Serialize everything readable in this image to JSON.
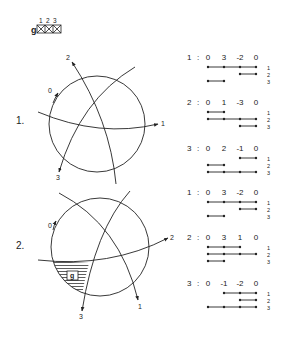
{
  "legend": {
    "prefix": "g",
    "columns": [
      "1",
      "2",
      "3"
    ]
  },
  "diagrams": [
    {
      "label": "1.",
      "curve_labels": {
        "c0": "0",
        "c1": "1",
        "c2": "2",
        "c3": "3"
      },
      "shaded_label": ""
    },
    {
      "label": "2.",
      "curve_labels": {
        "c0": "0",
        "c1": "1",
        "c2": "2",
        "c3": "3"
      },
      "shaded_label": "g"
    }
  ],
  "tables": [
    {
      "group": 1,
      "blocks": [
        {
          "head": "1",
          "sep": ":",
          "values": [
            "0",
            "3",
            "-2",
            "0"
          ],
          "rows": [
            {
              "label": "1",
              "from": 0,
              "to": 3
            },
            {
              "label": "2",
              "from": 2,
              "to": 3
            },
            {
              "label": "3",
              "from": 0,
              "to": 1
            }
          ]
        },
        {
          "head": "2",
          "sep": ":",
          "values": [
            "0",
            "1",
            "-3",
            "0"
          ],
          "rows": [
            {
              "label": "1",
              "from": 0,
              "to": 1
            },
            {
              "label": "2",
              "from": 0,
              "to": 3
            },
            {
              "label": "3",
              "from": 2,
              "to": 3
            }
          ]
        },
        {
          "head": "3",
          "sep": ":",
          "values": [
            "0",
            "2",
            "-1",
            "0"
          ],
          "rows": [
            {
              "label": "1",
              "from": 2,
              "to": 3
            },
            {
              "label": "2",
              "from": 0,
              "to": 1
            },
            {
              "label": "3",
              "from": 0,
              "to": 3
            }
          ]
        }
      ]
    },
    {
      "group": 2,
      "blocks": [
        {
          "head": "1",
          "sep": ":",
          "values": [
            "0",
            "3",
            "-2",
            "0"
          ],
          "rows": [
            {
              "label": "1",
              "from": 0,
              "to": 3
            },
            {
              "label": "2",
              "from": 2,
              "to": 3
            },
            {
              "label": "3",
              "from": 0,
              "to": 1
            }
          ]
        },
        {
          "head": "2",
          "sep": ":",
          "values": [
            "0",
            "3",
            "1",
            "0"
          ],
          "rows": [
            {
              "label": "1",
              "from": 0,
              "to": 2
            },
            {
              "label": "2",
              "from": 0,
              "to": 3
            },
            {
              "label": "3",
              "from": 0,
              "to": 1
            }
          ]
        },
        {
          "head": "3",
          "sep": ":",
          "values": [
            "0",
            "-1",
            "-2",
            "0"
          ],
          "rows": [
            {
              "label": "1",
              "from": 1,
              "to": 3
            },
            {
              "label": "2",
              "from": 2,
              "to": 3
            },
            {
              "label": "3",
              "from": 0,
              "to": 3
            }
          ]
        }
      ]
    }
  ]
}
